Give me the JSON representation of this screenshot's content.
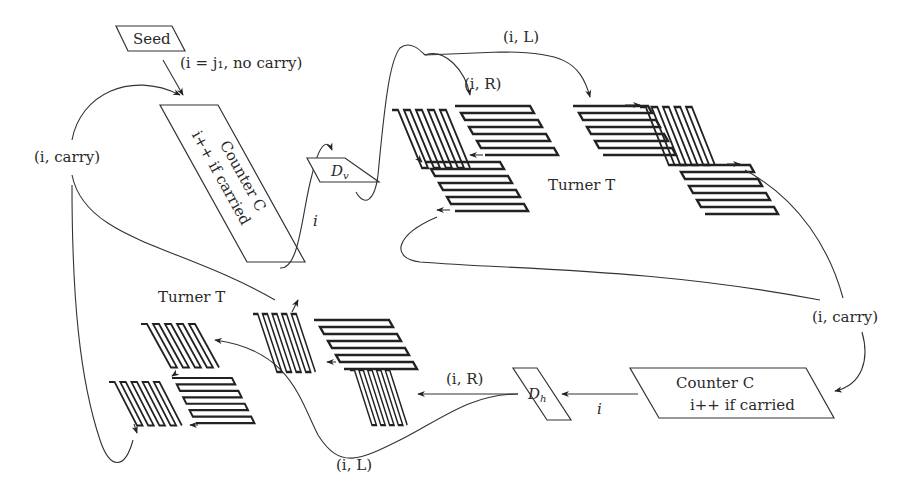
{
  "diagram": {
    "seed": {
      "label": "Seed",
      "init": "(i = j₁, no carry)"
    },
    "counter_top": {
      "title": "Counter C",
      "rule": "i++ if carried"
    },
    "counter_bottom": {
      "title": "Counter C",
      "rule": "i++ if carried"
    },
    "dv": {
      "label": "D",
      "sub": "v"
    },
    "dh": {
      "label": "D",
      "sub": "h"
    },
    "turner_top": {
      "label": "Turner T"
    },
    "turner_bottom": {
      "label": "Turner T"
    },
    "edges": {
      "i_top": "i",
      "iL_top": "(i, L)",
      "iR_top": "(i, R)",
      "carry_left": "(i, carry)",
      "carry_right": "(i, carry)",
      "i_bottom": "i",
      "iR_bottom": "(i, R)",
      "iL_bottom": "(i, L)"
    }
  }
}
